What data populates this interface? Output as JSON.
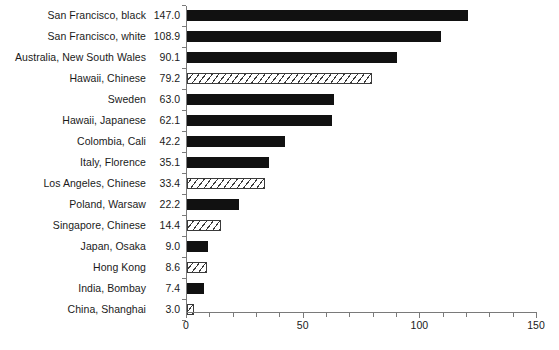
{
  "chart_data": {
    "type": "bar",
    "orientation": "horizontal",
    "title": "",
    "subtitle": "",
    "xlabel": "",
    "ylabel": "",
    "xlim": [
      0,
      150
    ],
    "grid": false,
    "legend": false,
    "x_major_ticks": [
      0,
      50,
      100,
      150
    ],
    "x_major_tick_labels": [
      "0",
      "50",
      "100",
      "150"
    ],
    "x_minor_tick_step": 10,
    "categories": [
      "San Francisco, black",
      "San Francisco, white",
      "Australia, New South Wales",
      "Hawaii, Chinese",
      "Sweden",
      "Hawaii, Japanese",
      "Colombia, Cali",
      "Italy, Florence",
      "Los Angeles, Chinese",
      "Poland, Warsaw",
      "Singapore, Chinese",
      "Japan, Osaka",
      "Hong Kong",
      "India, Bombay",
      "China, Shanghai"
    ],
    "values": [
      147.0,
      108.9,
      90.1,
      79.2,
      63.0,
      62.1,
      42.2,
      35.1,
      33.4,
      22.2,
      14.4,
      9.0,
      8.6,
      7.4,
      3.0
    ],
    "value_labels": [
      "147.0",
      "108.9",
      "90.1",
      "79.2",
      "63.0",
      "62.1",
      "42.2",
      "35.1",
      "33.4",
      "22.2",
      "14.4",
      "9.0",
      "8.6",
      "7.4",
      "3.0"
    ],
    "drawn_values": [
      120.5,
      108.9,
      90.1,
      79.2,
      63.0,
      62.1,
      42.2,
      35.1,
      33.4,
      22.2,
      14.4,
      9.0,
      8.6,
      7.4,
      3.0
    ],
    "bar_fills": [
      "solid",
      "solid",
      "solid",
      "hatch",
      "solid",
      "solid",
      "solid",
      "solid",
      "hatch",
      "solid",
      "hatch",
      "solid",
      "hatch",
      "solid",
      "hatch"
    ],
    "colors": {
      "solid": "#111111",
      "hatch_line": "#3a3a3a",
      "hatch_background": "#ffffff",
      "axis": "#7a7a7a",
      "text": "#1a1a1a",
      "background": "#ffffff"
    }
  },
  "axis": {
    "x_labels": [
      "0",
      "50",
      "100",
      "150"
    ]
  }
}
